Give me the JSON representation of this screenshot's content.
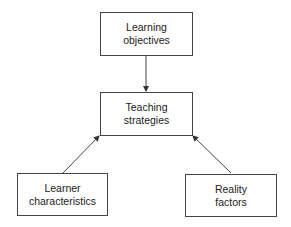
{
  "diagram": {
    "nodes": [
      {
        "id": "learning-objectives",
        "label": "Learning\nobjectives"
      },
      {
        "id": "teaching-strategies",
        "label": "Teaching\nstrategies"
      },
      {
        "id": "learner-characteristics",
        "label": "Learner\ncharacteristics"
      },
      {
        "id": "reality-factors",
        "label": "Reality\nfactors"
      }
    ],
    "edges": [
      {
        "from": "learning-objectives",
        "to": "teaching-strategies"
      },
      {
        "from": "learner-characteristics",
        "to": "teaching-strategies"
      },
      {
        "from": "reality-factors",
        "to": "teaching-strategies"
      }
    ],
    "colors": {
      "stroke": "#444444",
      "text": "#222222",
      "background": "#ffffff"
    }
  }
}
